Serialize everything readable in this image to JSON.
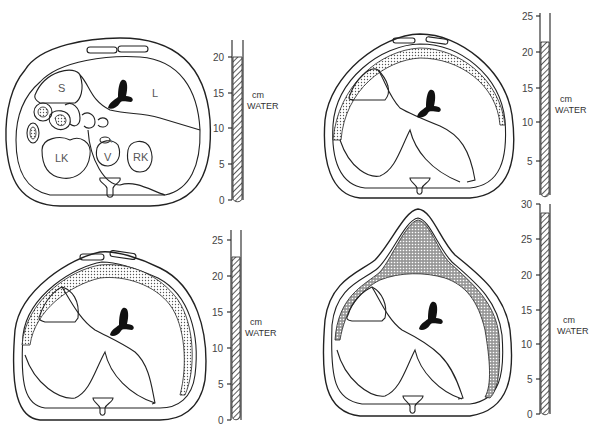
{
  "figure": {
    "panels": [
      {
        "id": "panel-1",
        "position": "top-left",
        "description": "Abdominal cross-section, normal",
        "organ_labels": [
          "S",
          "L",
          "LK",
          "V",
          "RK",
          "A"
        ],
        "gauge": {
          "unit_line1": "cm",
          "unit_line2": "WATER",
          "ticks": [
            "0",
            "5",
            "10",
            "15",
            "20"
          ],
          "max": 20,
          "level": 20
        }
      },
      {
        "id": "panel-2",
        "position": "top-right",
        "description": "Cross-section with thin peritoneal fluid layer",
        "gauge": {
          "unit_line1": "cm",
          "unit_line2": "WATER",
          "ticks": [
            "5",
            "10",
            "15",
            "20",
            "25"
          ],
          "max": 25,
          "level": 21
        }
      },
      {
        "id": "panel-3",
        "position": "bottom-left",
        "description": "Cross-section with thicker fluid layer",
        "gauge": {
          "unit_line1": "cm",
          "unit_line2": "WATER",
          "ticks": [
            "0",
            "5",
            "10",
            "15",
            "20",
            "25"
          ],
          "max": 25,
          "level": 22.5
        }
      },
      {
        "id": "panel-4",
        "position": "bottom-right",
        "description": "Cross-section with large anterior fluid collection",
        "gauge": {
          "unit_line1": "cm",
          "unit_line2": "WATER",
          "ticks": [
            "0",
            "5",
            "10",
            "15",
            "20",
            "25",
            "30"
          ],
          "max": 30,
          "level": 29
        }
      }
    ]
  }
}
